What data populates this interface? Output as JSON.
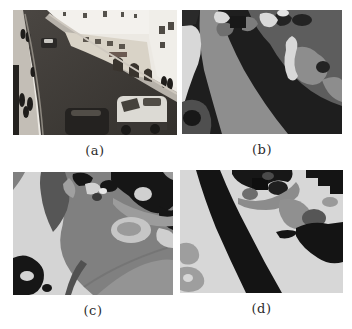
{
  "page": {
    "background": "#ffffff"
  },
  "figure": {
    "panels": [
      {
        "id": "a",
        "label": "(a)"
      },
      {
        "id": "b",
        "label": "(b)"
      },
      {
        "id": "c",
        "label": "(c)"
      },
      {
        "id": "d",
        "label": "(d)"
      }
    ],
    "palette": {
      "segment_black": "#181818",
      "segment_dark_gray": "#4f4f4f",
      "segment_mid_gray": "#808080",
      "segment_gray": "#9a9a9a",
      "segment_light_gray": "#d6d6d6",
      "photo_highlight": "#f2f0ec",
      "label_color": "#2b2b2b"
    }
  }
}
